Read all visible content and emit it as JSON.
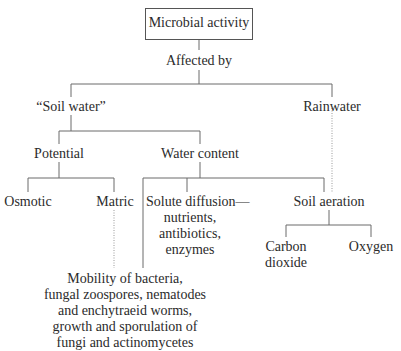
{
  "diagram": {
    "root": "Microbial activity",
    "affected_by": "Affected by",
    "soil_water": "“Soil water”",
    "rainwater": "Rainwater",
    "potential": "Potential",
    "water_content": "Water content",
    "osmotic": "Osmotic",
    "matric": "Matric",
    "solute_diffusion": {
      "line1": "Solute diffusion—",
      "line2": "nutrients,",
      "line3": "antibiotics,",
      "line4": "enzymes"
    },
    "soil_aeration": "Soil aeration",
    "carbon_dioxide": {
      "line1": "Carbon",
      "line2": "dioxide"
    },
    "oxygen": "Oxygen",
    "mobility": {
      "line1": "Mobility of bacteria,",
      "line2": "fungal zoospores, nematodes",
      "line3": "and enchytraeid worms,",
      "line4": "growth and sporulation of",
      "line5": "fungi and actinomycetes"
    }
  }
}
